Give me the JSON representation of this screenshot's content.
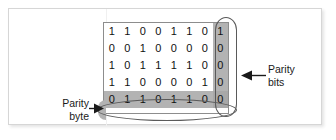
{
  "figure": {
    "caption_title": "Parity checking matrix",
    "matrix": {
      "rows": [
        {
          "name": "data-row-1",
          "data_bits": [
            "1",
            "1",
            "0",
            "0",
            "1",
            "1",
            "0"
          ],
          "parity_bit": "1"
        },
        {
          "name": "data-row-2",
          "data_bits": [
            "0",
            "0",
            "1",
            "0",
            "0",
            "0",
            "0"
          ],
          "parity_bit": "0"
        },
        {
          "name": "data-row-3",
          "data_bits": [
            "1",
            "0",
            "1",
            "1",
            "1",
            "1",
            "0"
          ],
          "parity_bit": "0"
        },
        {
          "name": "data-row-4",
          "data_bits": [
            "1",
            "1",
            "0",
            "0",
            "0",
            "0",
            "1"
          ],
          "parity_bit": "0"
        }
      ],
      "parity_byte_row": {
        "name": "parity-byte-row",
        "data_bits": [
          "0",
          "1",
          "1",
          "0",
          "1",
          "1",
          "0"
        ],
        "parity_bit": "0"
      }
    },
    "annotations": {
      "parity_bits": {
        "line1": "Parity",
        "line2": "bits"
      },
      "parity_byte": {
        "line1": "Parity",
        "line2": "byte"
      }
    },
    "colors": {
      "highlight_fill": "#b3b3b3",
      "highlight_stroke": "#5a5a5a",
      "grid_border": "#8d8d8d",
      "card_border": "#d6d6d6",
      "text": "#111111"
    }
  }
}
